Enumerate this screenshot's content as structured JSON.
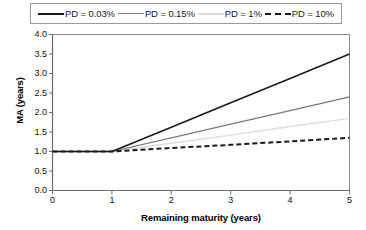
{
  "chart_data": {
    "type": "line",
    "title": "",
    "xlabel": "Remaining maturity (years)",
    "ylabel": "MA (years)",
    "xlim": [
      0,
      5
    ],
    "ylim": [
      0,
      4
    ],
    "xticks": [
      "0",
      "1",
      "2",
      "3",
      "4",
      "5"
    ],
    "yticks": [
      "0.0",
      "0.5",
      "1.0",
      "1.5",
      "2.0",
      "2.5",
      "3.0",
      "3.5",
      "4.0"
    ],
    "grid": false,
    "legend_position": "top",
    "x": [
      0,
      1,
      2,
      3,
      4,
      5
    ],
    "series": [
      {
        "name": "PD = 0.03%",
        "values": [
          1.0,
          1.0,
          1.62,
          2.25,
          2.87,
          3.5
        ],
        "color": "#1a1a1a",
        "style": "solid",
        "width": 1.6
      },
      {
        "name": "PD = 0.15%",
        "values": [
          1.0,
          1.0,
          1.35,
          1.7,
          2.05,
          2.4
        ],
        "color": "#7a7a7a",
        "style": "solid",
        "width": 1.2
      },
      {
        "name": "PD = 1%",
        "values": [
          1.0,
          1.0,
          1.21,
          1.42,
          1.64,
          1.85
        ],
        "color": "#dcdcdc",
        "style": "solid",
        "width": 1.4
      },
      {
        "name": "PD = 10%",
        "values": [
          1.0,
          1.0,
          1.09,
          1.17,
          1.26,
          1.35
        ],
        "color": "#1a1a1a",
        "style": "dashed",
        "width": 2.0
      }
    ]
  },
  "legend": {
    "items": [
      {
        "label": "PD = 0.03%",
        "color": "#1a1a1a",
        "style": "solid",
        "width": "2px"
      },
      {
        "label": "PD = 0.15%",
        "color": "#7a7a7a",
        "style": "solid",
        "width": "1.5px"
      },
      {
        "label": "PD = 1%",
        "color": "#dcdcdc",
        "style": "solid",
        "width": "2px"
      },
      {
        "label": "PD = 10%",
        "color": "#1a1a1a",
        "style": "dashed",
        "width": "2px"
      }
    ]
  },
  "axes": {
    "y_title": "MA (years)",
    "x_title": "Remaining maturity (years)"
  },
  "colors": {
    "frame": "#8c8c8c",
    "axis": "#6e6e6e",
    "background": "#ffffff"
  }
}
